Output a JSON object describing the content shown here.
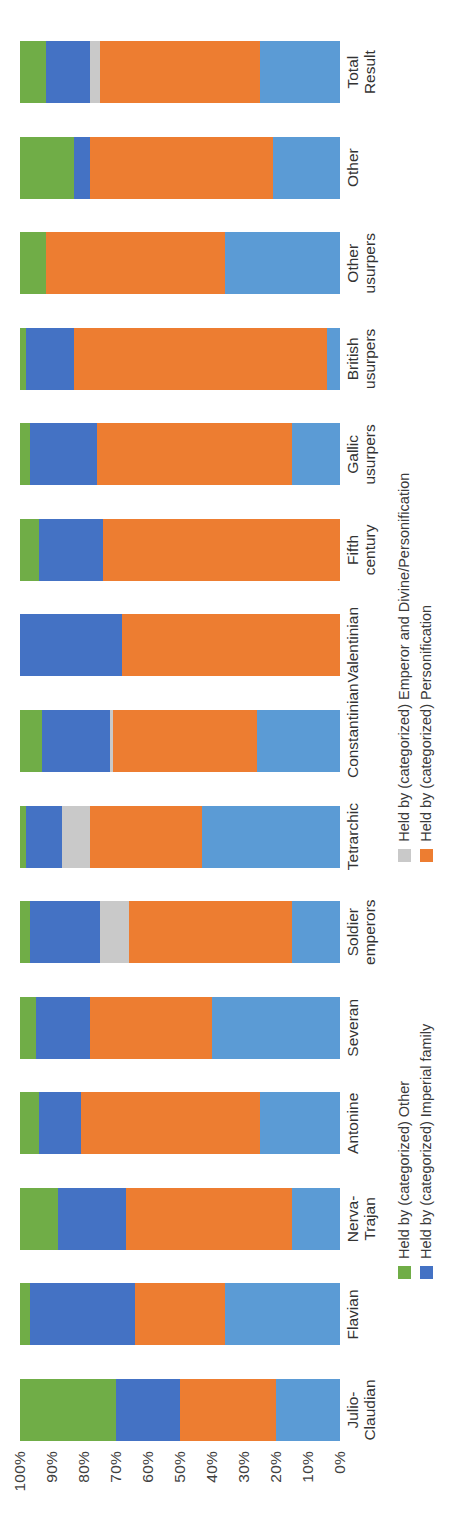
{
  "chart_data": {
    "type": "bar",
    "title": "",
    "subtitle": "",
    "xlabel": "",
    "ylabel": "",
    "stacked": true,
    "normalized": "100%",
    "orientation": "vertical-rotated-90ccw",
    "grid": false,
    "legend_position": "bottom",
    "ylim": [
      0,
      100
    ],
    "ytick_labels": [
      "100%",
      "90%",
      "80%",
      "70%",
      "60%",
      "50%",
      "40%",
      "30%",
      "20%",
      "10%",
      "0%"
    ],
    "ytick_values": [
      100,
      90,
      80,
      70,
      60,
      50,
      40,
      30,
      20,
      10,
      0
    ],
    "categories": [
      "Julio-Claudian",
      "Flavian",
      "Nerva-Trajan",
      "Antonine",
      "Severan",
      "Soldier emperors",
      "Tetrarchic",
      "Constantinian",
      "Valentinian",
      "Fifth century",
      "Gallic usurpers",
      "British usurpers",
      "Other usurpers",
      "Other",
      "Total Result"
    ],
    "series": [
      {
        "name": "Held by (categorized) Emperor",
        "color": "#5b9bd5",
        "values": [
          20,
          36,
          15,
          25,
          40,
          15,
          43,
          26,
          0,
          0,
          15,
          4,
          36,
          21,
          25
        ]
      },
      {
        "name": "Held by (categorized) Personification",
        "color": "#ed7d31",
        "values": [
          30,
          28,
          52,
          56,
          38,
          51,
          35,
          45,
          68,
          74,
          61,
          79,
          56,
          57,
          50
        ]
      },
      {
        "name": "Held by (categorized) Emperor and Divine/Personification",
        "color": "#c9c9c9",
        "values": [
          0,
          0,
          0,
          0,
          0,
          9,
          9,
          1,
          0,
          0,
          0,
          0,
          0,
          0,
          3
        ]
      },
      {
        "name": "Held by (categorized) Imperial family",
        "color": "#4472c4",
        "values": [
          20,
          33,
          21,
          13,
          17,
          22,
          11,
          21,
          32,
          20,
          21,
          15,
          0,
          5,
          14
        ]
      },
      {
        "name": "Held by (categorized) Other",
        "color": "#70ad47",
        "values": [
          30,
          3,
          12,
          6,
          5,
          3,
          2,
          7,
          0,
          6,
          3,
          2,
          8,
          17,
          8
        ]
      }
    ]
  },
  "yaxis": {
    "ticks": [
      {
        "label": "100%"
      },
      {
        "label": "90%"
      },
      {
        "label": "80%"
      },
      {
        "label": "70%"
      },
      {
        "label": "60%"
      },
      {
        "label": "50%"
      },
      {
        "label": "40%"
      },
      {
        "label": "30%"
      },
      {
        "label": "20%"
      },
      {
        "label": "10%"
      },
      {
        "label": "0%"
      }
    ]
  },
  "xaxis": {
    "labels": [
      {
        "text": "Julio-Claudian"
      },
      {
        "text": "Flavian"
      },
      {
        "text": "Nerva-Trajan"
      },
      {
        "text": "Antonine"
      },
      {
        "text": "Severan"
      },
      {
        "text": "Soldier emperors"
      },
      {
        "text": "Tetrarchic"
      },
      {
        "text": "Constantinian"
      },
      {
        "text": "Valentinian"
      },
      {
        "text": "Fifth century"
      },
      {
        "text": "Gallic usurpers"
      },
      {
        "text": "British usurpers"
      },
      {
        "text": "Other usurpers"
      },
      {
        "text": "Other"
      },
      {
        "text": "Total Result"
      }
    ]
  },
  "legend": {
    "items": [
      {
        "label": "Held by (categorized) Other",
        "color": "#70ad47"
      },
      {
        "label": "Held by (categorized) Imperial family",
        "color": "#4472c4"
      },
      {
        "label": "Held by (categorized) Emperor and Divine/Personification",
        "color": "#c9c9c9"
      },
      {
        "label": "Held by (categorized) Personification",
        "color": "#ed7d31"
      }
    ]
  },
  "colors": {
    "other": "#70ad47",
    "imperial_family": "#4472c4",
    "emperor_and_divine": "#c9c9c9",
    "personification": "#ed7d31",
    "emperor": "#5b9bd5",
    "text": "#3a3a3a",
    "background": "#ffffff"
  }
}
